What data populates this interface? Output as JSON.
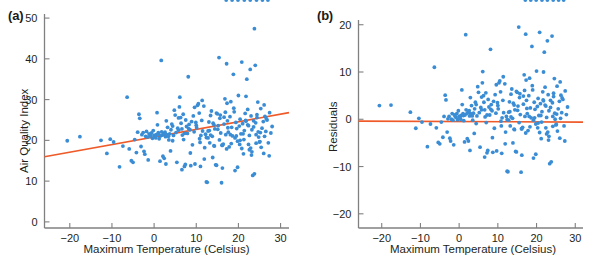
{
  "figure": {
    "width": 589,
    "height": 263,
    "background": "#ffffff",
    "point_color": "#3a8dd4",
    "line_color": "#ef5a28",
    "axis_color": "#808080",
    "text_color": "#231f20"
  },
  "chart_data": [
    {
      "type": "scatter",
      "panel": "a",
      "panel_label": "(a)",
      "title": "",
      "xlabel": "Maximum Temperature (Celsius)",
      "ylabel": "Air Quality Index",
      "xlim": [
        -26,
        32
      ],
      "ylim": [
        -1.5,
        51
      ],
      "xticks": [
        -20,
        -10,
        0,
        10,
        20,
        30
      ],
      "xticklabels": [
        "-20",
        "-10",
        "0",
        "10",
        "20",
        "30"
      ],
      "yticks": [
        0,
        10,
        20,
        30,
        40,
        50
      ],
      "yticklabels": [
        "0",
        "10",
        "20",
        "30",
        "40",
        "50"
      ],
      "grid": false,
      "legend": "none",
      "series": [
        {
          "name": "observations",
          "marker": "circle",
          "color": "#3a8dd4",
          "x": [
            -20.6,
            -17.6,
            -12.6,
            -11.2,
            -10.4,
            -9.6,
            -8.2,
            -7.4,
            -6.4,
            -5.9,
            -5.4,
            -5.0,
            -4.6,
            -4.2,
            -3.9,
            -3.6,
            -3.4,
            -3.1,
            -2.9,
            -2.6,
            -2.4,
            -2.2,
            -2.0,
            -1.8,
            -1.6,
            -1.4,
            -1.2,
            -1.0,
            -0.8,
            -0.6,
            -0.4,
            -0.2,
            0.0,
            0.2,
            0.4,
            0.5,
            0.7,
            0.8,
            1.0,
            1.1,
            1.2,
            1.4,
            1.5,
            1.7,
            1.8,
            2.0,
            2.1,
            2.3,
            2.4,
            2.6,
            2.7,
            2.9,
            3.0,
            3.2,
            3.4,
            3.5,
            3.7,
            3.9,
            4.0,
            4.2,
            4.4,
            4.6,
            4.8,
            5.0,
            5.2,
            5.4,
            5.6,
            5.8,
            6.0,
            6.1,
            6.3,
            6.4,
            6.6,
            6.7,
            6.9,
            7.0,
            7.2,
            7.4,
            7.5,
            7.7,
            7.9,
            8.1,
            8.3,
            8.5,
            8.7,
            8.9,
            9.1,
            9.3,
            9.5,
            9.7,
            9.9,
            10.1,
            10.3,
            10.5,
            10.7,
            10.9,
            11.1,
            11.3,
            11.5,
            11.8,
            12.0,
            12.2,
            12.4,
            12.6,
            12.8,
            13.0,
            13.2,
            13.4,
            13.6,
            13.8,
            14.0,
            14.2,
            14.4,
            14.6,
            14.8,
            15.0,
            15.2,
            15.4,
            15.6,
            15.8,
            16.0,
            16.2,
            16.4,
            16.6,
            16.8,
            17.0,
            17.2,
            17.4,
            17.6,
            17.8,
            18.0,
            18.2,
            18.4,
            18.6,
            18.8,
            19.0,
            19.2,
            19.4,
            19.6,
            19.8,
            20.0,
            20.2,
            20.4,
            20.6,
            20.8,
            21.0,
            21.2,
            21.4,
            21.6,
            21.8,
            22.0,
            22.2,
            22.4,
            22.6,
            22.8,
            23.0,
            23.2,
            23.4,
            23.6,
            23.8,
            24.0,
            24.2,
            24.4,
            24.6,
            24.8,
            25.0,
            25.3,
            25.6,
            25.9,
            26.2,
            26.5,
            26.8,
            27.1,
            27.4,
            27.7,
            28.0,
            2.8,
            6.6,
            11.0,
            16.2,
            17.2,
            18.1,
            21.3,
            22.4,
            23.1,
            23.8,
            24.2,
            16.6,
            19.2,
            20.3,
            21.8,
            22.9,
            24.4,
            25.2,
            26.0,
            13.1,
            14.2,
            15.5,
            16.9,
            18.3,
            19.8,
            21.1,
            22.6,
            24.1,
            25.4,
            26.3,
            12.4,
            13.9,
            15.1,
            17.3,
            19.5,
            20.8,
            22.2,
            23.6,
            25.1,
            26.6,
            27.3,
            8.2,
            9.6,
            10.8,
            11.9,
            13.4,
            14.8,
            16.1,
            17.5,
            18.9,
            20.4,
            21.7,
            23.2,
            24.7,
            26.1,
            4.4,
            5.8,
            7.2,
            8.6,
            10.0,
            11.4,
            12.8,
            14.3,
            15.7,
            17.1,
            18.5,
            19.9,
            21.4,
            22.8,
            24.3,
            25.7,
            27.0
          ],
          "y": [
            19.9,
            20.9,
            20.0,
            16.8,
            20.3,
            19.6,
            13.5,
            18.6,
            30.6,
            17.9,
            15.0,
            14.6,
            20.2,
            17.0,
            22.0,
            26.4,
            25.4,
            18.5,
            21.4,
            21.9,
            17.3,
            16.6,
            21.0,
            22.2,
            20.8,
            15.2,
            21.6,
            21.3,
            21.1,
            21.8,
            20.5,
            22.4,
            21.2,
            21.0,
            20.6,
            21.4,
            26.8,
            23.8,
            21.9,
            21.5,
            20.4,
            14.9,
            21.1,
            39.6,
            22.1,
            21.3,
            16.1,
            21.7,
            15.6,
            22.0,
            20.9,
            24.8,
            21.4,
            23.2,
            21.0,
            20.1,
            21.6,
            17.4,
            22.6,
            24.0,
            23.5,
            21.2,
            27.4,
            26.2,
            21.9,
            14.6,
            23.0,
            22.5,
            28.2,
            30.6,
            25.6,
            24.2,
            22.8,
            21.3,
            26.4,
            20.2,
            13.6,
            14.1,
            25.0,
            23.4,
            21.7,
            35.6,
            23.9,
            22.6,
            13.8,
            24.6,
            18.9,
            26.0,
            22.1,
            14.2,
            24.4,
            23.1,
            28.6,
            29.0,
            26.7,
            19.5,
            21.2,
            24.9,
            22.3,
            28.4,
            18.2,
            21.5,
            9.8,
            9.7,
            20.6,
            24.5,
            19.4,
            26.1,
            27.2,
            21.0,
            24.2,
            18.7,
            22.8,
            14.0,
            13.9,
            26.5,
            23.6,
            40.3,
            25.4,
            21.8,
            9.6,
            13.2,
            19.1,
            24.0,
            30.2,
            21.4,
            38.8,
            24.8,
            22.0,
            18.4,
            25.8,
            29.5,
            23.2,
            21.1,
            36.2,
            27.0,
            20.6,
            24.4,
            22.9,
            19.8,
            31.0,
            23.5,
            25.2,
            21.6,
            39.2,
            24.1,
            16.7,
            22.4,
            26.6,
            30.8,
            35.0,
            23.8,
            19.0,
            21.2,
            37.4,
            26.0,
            22.6,
            11.4,
            24.8,
            47.4,
            38.4,
            21.4,
            25.6,
            29.4,
            20.8,
            19.6,
            27.8,
            23.0,
            24.6,
            21.0,
            22.2,
            25.0,
            19.4,
            26.8,
            21.8,
            23.4,
            14.2,
            12.8,
            13.6,
            18.8,
            17.9,
            21.4,
            20.2,
            23.6,
            16.4,
            11.8,
            19.3,
            25.7,
            12.6,
            19.0,
            24.7,
            18.1,
            26.3,
            21.9,
            16.8,
            22.4,
            23.8,
            20.1,
            26.9,
            19.2,
            13.4,
            21.6,
            17.7,
            24.3,
            18.3,
            25.9,
            20.7,
            15.8,
            22.7,
            29.1,
            21.1,
            18.0,
            27.6,
            23.3,
            19.7,
            25.3,
            16.2,
            22.9,
            28.1,
            20.4,
            15.4,
            21.3,
            26.7,
            18.8,
            23.1,
            27.9,
            20.0,
            24.9,
            17.2,
            22.1,
            28.7,
            19.9,
            25.5,
            21.7,
            16.9,
            23.7,
            29.8,
            22.3,
            18.6,
            26.2
          ],
          "n_points": 245
        }
      ],
      "fit_line": {
        "name": "least-squares regression",
        "color": "#ef5a28",
        "x_start": -26.0,
        "y_start": 16.0,
        "x_end": 32.0,
        "y_end": 26.8,
        "slope": 0.186,
        "intercept": 20.84
      }
    },
    {
      "type": "scatter",
      "panel": "b",
      "panel_label": "(b)",
      "title": "",
      "xlabel": "Maximum Temperature (Celsius)",
      "ylabel": "Residuals",
      "xlim": [
        -26,
        32
      ],
      "ylim": [
        -23,
        21
      ],
      "xticks": [
        -20,
        -10,
        0,
        10,
        20,
        30
      ],
      "xticklabels": [
        "-20",
        "-10",
        "0",
        "10",
        "20",
        "30"
      ],
      "yticks": [
        -20,
        -10,
        0,
        10,
        20
      ],
      "yticklabels": [
        "-20",
        "-10",
        "0",
        "10",
        "20"
      ],
      "grid": false,
      "legend": "none",
      "series": [
        {
          "name": "residuals",
          "marker": "circle",
          "color": "#3a8dd4",
          "x": [
            -20.6,
            -17.6,
            -12.6,
            -11.2,
            -10.4,
            -9.6,
            -8.2,
            -7.4,
            -6.4,
            -5.9,
            -5.4,
            -5.0,
            -4.6,
            -4.2,
            -3.9,
            -3.6,
            -3.4,
            -3.1,
            -2.9,
            -2.6,
            -2.4,
            -2.2,
            -2.0,
            -1.8,
            -1.6,
            -1.4,
            -1.2,
            -1.0,
            -0.8,
            -0.6,
            -0.4,
            -0.2,
            0.0,
            0.2,
            0.4,
            0.5,
            0.7,
            0.8,
            1.0,
            1.1,
            1.2,
            1.4,
            1.5,
            1.7,
            1.8,
            2.0,
            2.1,
            2.3,
            2.4,
            2.6,
            2.7,
            2.9,
            3.0,
            3.2,
            3.4,
            3.5,
            3.7,
            3.9,
            4.0,
            4.2,
            4.4,
            4.6,
            4.8,
            5.0,
            5.2,
            5.4,
            5.6,
            5.8,
            6.0,
            6.1,
            6.3,
            6.4,
            6.6,
            6.7,
            6.9,
            7.0,
            7.2,
            7.4,
            7.5,
            7.7,
            7.9,
            8.1,
            8.3,
            8.5,
            8.7,
            8.9,
            9.1,
            9.3,
            9.5,
            9.7,
            9.9,
            10.1,
            10.3,
            10.5,
            10.7,
            10.9,
            11.1,
            11.3,
            11.5,
            11.8,
            12.0,
            12.2,
            12.4,
            12.6,
            12.8,
            13.0,
            13.2,
            13.4,
            13.6,
            13.8,
            14.0,
            14.2,
            14.4,
            14.6,
            14.8,
            15.0,
            15.2,
            15.4,
            15.6,
            15.8,
            16.0,
            16.2,
            16.4,
            16.6,
            16.8,
            17.0,
            17.2,
            17.4,
            17.6,
            17.8,
            18.0,
            18.2,
            18.4,
            18.6,
            18.8,
            19.0,
            19.2,
            19.4,
            19.6,
            19.8,
            20.0,
            20.2,
            20.4,
            20.6,
            20.8,
            21.0,
            21.2,
            21.4,
            21.6,
            21.8,
            22.0,
            22.2,
            22.4,
            22.6,
            22.8,
            23.0,
            23.2,
            23.4,
            23.6,
            23.8,
            24.0,
            24.2,
            24.4,
            24.6,
            24.8,
            25.0,
            25.3,
            25.6,
            25.9,
            26.2,
            26.5,
            26.8,
            27.1,
            27.4,
            27.7,
            28.0,
            2.8,
            6.6,
            11.0,
            16.2,
            17.2,
            18.1,
            21.3,
            22.4,
            23.1,
            23.8,
            24.2,
            16.6,
            19.2,
            20.3,
            21.8,
            22.9,
            24.4,
            25.2,
            26.0,
            13.1,
            14.2,
            15.5,
            16.9,
            18.3,
            19.8,
            21.1,
            22.6,
            24.1,
            25.4,
            26.3,
            12.4,
            13.9,
            15.1,
            17.3,
            19.5,
            20.8,
            22.2,
            23.6,
            25.1,
            26.6,
            27.3,
            8.2,
            9.6,
            10.8,
            11.9,
            13.4,
            14.8,
            16.1,
            17.5,
            18.9,
            20.4,
            21.7,
            23.2,
            24.7,
            26.1,
            4.4,
            5.8,
            7.2,
            8.6,
            10.0,
            11.4,
            12.8,
            14.3,
            15.7,
            17.1,
            18.5,
            19.9,
            21.4,
            22.8,
            24.3,
            25.7,
            27.0
          ],
          "y": [
            2.9,
            3.0,
            1.5,
            -1.9,
            0.2,
            -0.6,
            -5.8,
            -1.0,
            11.0,
            -1.8,
            -4.9,
            -5.2,
            -0.6,
            -3.8,
            0.6,
            5.1,
            4.1,
            -2.7,
            0.1,
            0.6,
            -4.0,
            -4.6,
            0.0,
            1.2,
            -0.2,
            -5.4,
            0.9,
            0.6,
            0.4,
            1.2,
            -0.1,
            1.8,
            0.6,
            0.4,
            0.0,
            0.8,
            6.2,
            3.1,
            1.2,
            0.8,
            -0.3,
            -4.8,
            0.9,
            17.9,
            2.0,
            1.2,
            -4.1,
            1.5,
            -4.6,
            1.8,
            0.7,
            4.6,
            1.2,
            2.9,
            0.7,
            -0.2,
            1.3,
            -3.0,
            2.2,
            3.6,
            3.1,
            0.7,
            6.9,
            5.7,
            1.4,
            -5.9,
            2.5,
            2.0,
            7.7,
            10.1,
            5.0,
            3.6,
            2.0,
            0.5,
            5.6,
            -0.7,
            -7.1,
            -6.6,
            4.2,
            2.6,
            0.9,
            14.8,
            3.1,
            1.8,
            -7.0,
            3.8,
            -1.9,
            5.2,
            1.3,
            -6.7,
            3.5,
            2.2,
            7.7,
            8.1,
            5.8,
            -1.4,
            0.3,
            4.0,
            1.4,
            7.5,
            -2.7,
            0.6,
            -11.0,
            -11.1,
            -0.2,
            3.7,
            -1.4,
            5.3,
            6.4,
            0.2,
            3.4,
            -2.1,
            2.0,
            -6.8,
            -6.9,
            5.7,
            2.8,
            19.5,
            4.6,
            1.0,
            -11.2,
            -7.6,
            -1.7,
            3.2,
            9.4,
            0.6,
            18.0,
            4.0,
            1.2,
            -2.4,
            5.0,
            8.7,
            2.4,
            0.3,
            15.4,
            6.2,
            -0.2,
            3.6,
            2.1,
            -1.0,
            10.2,
            2.7,
            4.4,
            0.8,
            18.4,
            3.3,
            -4.1,
            1.6,
            5.8,
            10.0,
            14.2,
            3.0,
            -1.8,
            0.4,
            16.6,
            5.2,
            1.8,
            -9.4,
            4.0,
            26.6,
            17.6,
            0.6,
            4.8,
            8.6,
            0.0,
            -1.2,
            7.0,
            2.2,
            3.8,
            0.2,
            1.4,
            4.2,
            -1.4,
            6.0,
            1.0,
            2.6,
            -6.6,
            -8.0,
            -7.2,
            -2.0,
            -2.9,
            0.6,
            -0.6,
            2.8,
            -4.4,
            -9.0,
            -1.5,
            4.9,
            -8.2,
            -1.8,
            3.9,
            -2.7,
            5.5,
            1.1,
            -4.0,
            1.6,
            3.0,
            -0.7,
            6.1,
            -1.6,
            -7.4,
            0.8,
            -3.1,
            3.5,
            -2.5,
            5.1,
            -0.1,
            -5.0,
            1.9,
            8.3,
            0.3,
            -2.8,
            6.8,
            2.5,
            -1.1,
            4.5,
            -4.6,
            2.1,
            7.3,
            -0.4,
            -5.2,
            0.5,
            5.9,
            -2.0,
            2.3,
            7.1,
            -0.8,
            4.1,
            -3.6,
            1.3,
            7.9,
            -0.9,
            4.7,
            0.9,
            -3.9,
            2.9,
            9.0,
            1.5,
            -2.2,
            5.4
          ],
          "n_points": 245
        }
      ],
      "fit_line": {
        "name": "zero reference line",
        "color": "#ef5a28",
        "x_start": -26.0,
        "y_start": -0.4,
        "x_end": 32.0,
        "y_end": -0.6,
        "slope": 0.0,
        "intercept": -0.5
      }
    }
  ]
}
